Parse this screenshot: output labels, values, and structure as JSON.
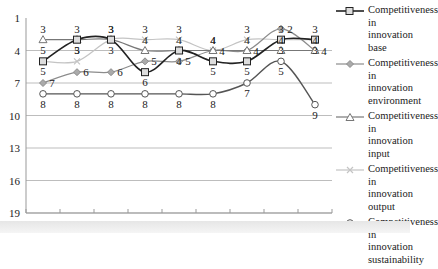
{
  "chart_data": {
    "type": "line",
    "title": "",
    "xlabel": "",
    "ylabel": "",
    "x": [
      "2001",
      "2002",
      "2003",
      "2004",
      "2005",
      "2006",
      "2007",
      "2008",
      "2009"
    ],
    "y_axis": {
      "ticks": [
        1,
        4,
        7,
        10,
        13,
        16,
        19
      ],
      "range": [
        1,
        19
      ],
      "inverted": true
    },
    "grid": true,
    "legend_position": "right",
    "series": [
      {
        "name": "Competitiveness in innovation base",
        "marker": "square",
        "color": "#222222",
        "width": 1.6,
        "values": [
          5,
          3,
          3,
          6,
          4,
          5,
          5,
          3,
          3
        ]
      },
      {
        "name": "Competitiveness in innovation environment",
        "marker": "diamond",
        "color": "#8c8c8c",
        "width": 1.2,
        "values": [
          7,
          6,
          6,
          5,
          5,
          4,
          4,
          2,
          4
        ]
      },
      {
        "name": "Competitiveness in innovation input",
        "marker": "triangle",
        "color": "#777777",
        "width": 1.2,
        "values": [
          3,
          3,
          3,
          4,
          4,
          4,
          4,
          4,
          4
        ]
      },
      {
        "name": "Competitiveness in innovation output",
        "marker": "x",
        "color": "#c4c4c4",
        "width": 1.2,
        "values": [
          5,
          5,
          3,
          3,
          3,
          4,
          3,
          3,
          3
        ]
      },
      {
        "name": "Competitiveness in innovation sustainability",
        "marker": "circle",
        "color": "#555555",
        "width": 1.4,
        "values": [
          8,
          8,
          8,
          8,
          8,
          8,
          7,
          5,
          9
        ]
      }
    ],
    "data_labels": [
      {
        "series": 0,
        "labels": [
          "5",
          "3",
          "3",
          "6",
          "4",
          "5",
          "5",
          "3",
          "3"
        ]
      },
      {
        "series": 1,
        "labels": [
          "7",
          "6",
          "6",
          "5",
          "5",
          "4",
          "4",
          "2",
          "4"
        ]
      },
      {
        "series": 2,
        "labels": [
          "3",
          "3",
          "3",
          "4",
          "4",
          "4",
          "4",
          "4",
          "4"
        ]
      },
      {
        "series": 3,
        "labels": [
          "5",
          "5",
          "3",
          "3",
          "3",
          "4",
          "3",
          "3",
          "3"
        ]
      },
      {
        "series": 4,
        "labels": [
          "8",
          "8",
          "8",
          "8",
          "8",
          "8",
          "7",
          "5",
          "9"
        ]
      }
    ]
  },
  "legend": {
    "items": [
      {
        "label": "Competitiveness in innovation base"
      },
      {
        "label": "Competitiveness in innovation environment"
      },
      {
        "label": "Competitiveness in innovation input"
      },
      {
        "label": "Competitiveness in innovation output"
      },
      {
        "label": "Competitiveness in innovation sustainability"
      }
    ]
  }
}
